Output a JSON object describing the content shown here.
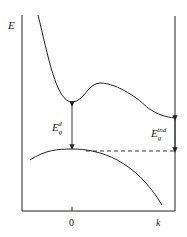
{
  "diagram": {
    "y_axis_label": "E",
    "x_tick_zero": "0",
    "x_tick_k": "k",
    "direct_gap": {
      "base": "E",
      "sub": "g",
      "sup": "d"
    },
    "indirect_gap": {
      "base": "E",
      "sub": "g",
      "sup": "ind"
    }
  }
}
